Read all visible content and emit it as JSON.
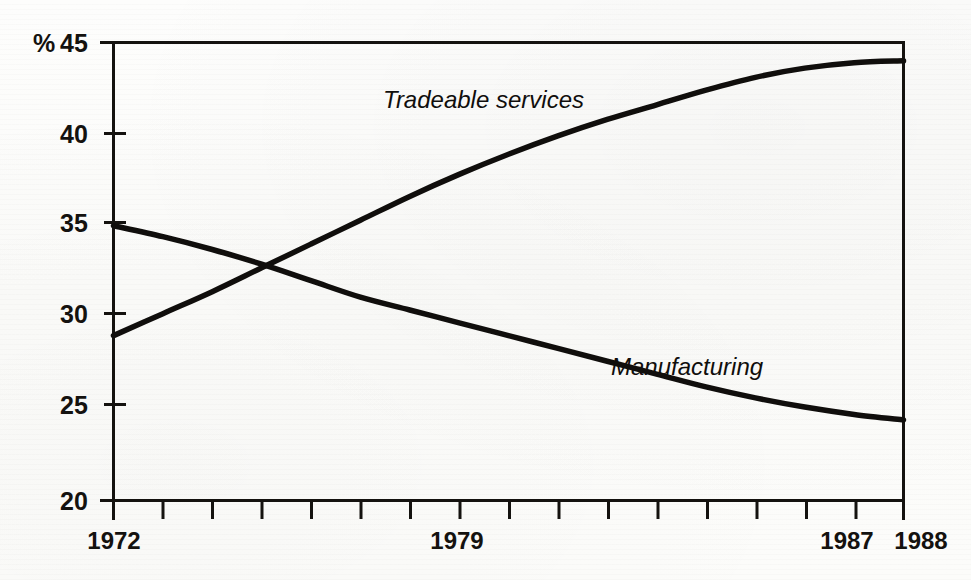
{
  "chart_data": {
    "type": "line",
    "title": "",
    "subtitle": "",
    "xlabel": "",
    "ylabel": "%",
    "ylim": [
      20,
      45
    ],
    "xlim": [
      1972,
      1988
    ],
    "grid": false,
    "legend_position": "inline-annotations",
    "y_ticks": [
      20,
      25,
      30,
      35,
      40,
      45
    ],
    "y_tick_labels": [
      "20",
      "25",
      "30",
      "35",
      "40",
      "45"
    ],
    "y_unit_label": "%",
    "x_ticks": [
      1972,
      1973,
      1974,
      1975,
      1976,
      1977,
      1978,
      1979,
      1980,
      1981,
      1982,
      1983,
      1984,
      1985,
      1986,
      1987,
      1988
    ],
    "x_tick_labels_shown": [
      "1972",
      "1979",
      "1987",
      "1988"
    ],
    "x_tick_label_positions": [
      1972,
      1979,
      1987,
      1988
    ],
    "x": [
      1972,
      1973,
      1974,
      1975,
      1976,
      1977,
      1978,
      1979,
      1980,
      1981,
      1982,
      1983,
      1984,
      1985,
      1986,
      1987,
      1988
    ],
    "series": [
      {
        "name": "Tradeable services",
        "label": "Tradeable services",
        "color": "#100e0c",
        "values": [
          29.0,
          30.2,
          31.4,
          32.7,
          34.0,
          35.3,
          36.6,
          37.8,
          38.9,
          39.9,
          40.8,
          41.6,
          42.4,
          43.1,
          43.6,
          43.9,
          44.0
        ]
      },
      {
        "name": "Manufacturing",
        "label": "Manufacturing",
        "color": "#100e0c",
        "values": [
          35.0,
          34.4,
          33.7,
          32.9,
          32.0,
          31.1,
          30.4,
          29.7,
          29.0,
          28.3,
          27.6,
          26.9,
          26.2,
          25.6,
          25.1,
          24.7,
          24.4
        ]
      }
    ],
    "annotations": [
      {
        "text": "Tradeable services",
        "x": 1978.0,
        "y": 41.9,
        "style": "italic"
      },
      {
        "text": "Manufacturing",
        "x": 1984.3,
        "y": 28.6,
        "style": "italic"
      }
    ],
    "crossover": {
      "x": 1974.8,
      "y": 32.4
    }
  }
}
